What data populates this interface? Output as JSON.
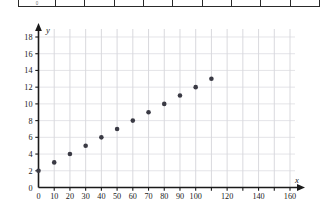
{
  "table_fragment": {
    "name": "table-bottom-row-fragment",
    "cells": [
      "",
      "",
      "",
      "",
      "",
      "",
      "",
      "",
      "",
      ""
    ],
    "ghost_text": "0"
  },
  "chart_data": {
    "type": "scatter",
    "title": "",
    "subtitle": "",
    "xlabel": "x",
    "ylabel": "y",
    "xlim": [
      0,
      170
    ],
    "ylim": [
      0,
      19.5
    ],
    "grid": true,
    "legend": null,
    "legend_position": "none",
    "x_ticks": [
      0,
      10,
      20,
      30,
      40,
      50,
      60,
      70,
      80,
      90,
      100,
      110,
      120,
      130,
      140,
      150,
      160
    ],
    "x_tick_labels": [
      "0",
      "10",
      "20",
      "30",
      "40",
      "50",
      "60",
      "70",
      "80",
      "90",
      "100",
      "",
      "120",
      "",
      "140",
      "",
      "160"
    ],
    "y_ticks": [
      0,
      2,
      4,
      6,
      8,
      10,
      12,
      14,
      16,
      18
    ],
    "y_tick_labels": [
      "0",
      "2",
      "4",
      "6",
      "8",
      "10",
      "12",
      "14",
      "16",
      "18"
    ],
    "x_gridlines": [
      10,
      20,
      30,
      40,
      50,
      60,
      70,
      80,
      90,
      100,
      110,
      120,
      130,
      140,
      150,
      160
    ],
    "y_gridlines": [
      2,
      4,
      6,
      8,
      10,
      12,
      14,
      16,
      18
    ],
    "points": [
      {
        "x": 0,
        "y": 2
      },
      {
        "x": 10,
        "y": 3
      },
      {
        "x": 20,
        "y": 4
      },
      {
        "x": 30,
        "y": 5
      },
      {
        "x": 40,
        "y": 6
      },
      {
        "x": 50,
        "y": 7
      },
      {
        "x": 60,
        "y": 8
      },
      {
        "x": 70,
        "y": 9
      },
      {
        "x": 80,
        "y": 10
      },
      {
        "x": 90,
        "y": 11
      },
      {
        "x": 100,
        "y": 12
      },
      {
        "x": 110,
        "y": 13
      }
    ],
    "marker": {
      "shape": "circle",
      "radius": 2.3,
      "color": "#3a3a44"
    },
    "axis_color": "#1a1a1a",
    "grid_color": "#c9c9cf"
  }
}
